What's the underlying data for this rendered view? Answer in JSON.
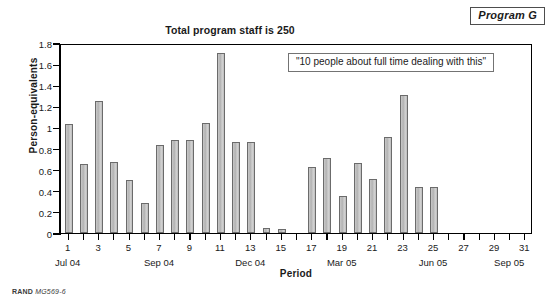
{
  "program_tag": "Program G",
  "title": "Total program staff is 250",
  "callout": "\"10 people about full time dealing with this\"",
  "footer": {
    "brand": "RAND",
    "doc_id": "MG569-6"
  },
  "axes": {
    "y_title": "Person-equivalents",
    "x_title": "Period",
    "y_ticks": [
      "0",
      "0.2",
      "0.4",
      "0.6",
      "0.8",
      "1",
      "1.2",
      "1.4",
      "1.6",
      "1.8"
    ],
    "x_ticks": [
      "1",
      "3",
      "5",
      "7",
      "9",
      "11",
      "13",
      "15",
      "17",
      "19",
      "21",
      "23",
      "25",
      "27",
      "29",
      "31"
    ],
    "x_month_labels": [
      "Jul 04",
      "Sep 04",
      "Dec 04",
      "Mar 05",
      "Jun 05",
      "Sep 05"
    ]
  },
  "chart_data": {
    "type": "bar",
    "title": "Total program staff is 250",
    "xlabel": "Period",
    "ylabel": "Person-equivalents",
    "ylim": [
      0,
      1.8
    ],
    "ytick_step": 0.2,
    "xlim": [
      0.4,
      31.6
    ],
    "grid": false,
    "legend": null,
    "bar_fill": "#c2c2c2",
    "bar_edge": "#6b6b6b",
    "annotations": [
      {
        "text": "\"10 people about full time dealing with this\"",
        "kind": "boxed-callout"
      },
      {
        "text": "Program G",
        "kind": "boxed-corner-label"
      }
    ],
    "month_ticks": [
      {
        "period": 1,
        "label": "Jul 04"
      },
      {
        "period": 7,
        "label": "Sep 04"
      },
      {
        "period": 13,
        "label": "Dec 04"
      },
      {
        "period": 19,
        "label": "Mar 05"
      },
      {
        "period": 25,
        "label": "Jun 05"
      },
      {
        "period": 30,
        "label": "Sep 05"
      }
    ],
    "categories": [
      1,
      2,
      3,
      4,
      5,
      6,
      7,
      8,
      9,
      10,
      11,
      12,
      13,
      14,
      15,
      16,
      17,
      18,
      19,
      20,
      21,
      22,
      23,
      24,
      25,
      26,
      27,
      28,
      29,
      30,
      31
    ],
    "values": [
      1.03,
      0.65,
      1.25,
      0.67,
      0.5,
      0.28,
      0.83,
      0.88,
      0.88,
      1.04,
      1.71,
      0.86,
      0.86,
      0.05,
      0.04,
      0.0,
      0.63,
      0.71,
      0.35,
      0.66,
      0.51,
      0.91,
      1.31,
      0.44,
      0.44,
      0.0,
      0.0,
      0.0,
      0.0,
      0.0,
      0.0
    ]
  }
}
